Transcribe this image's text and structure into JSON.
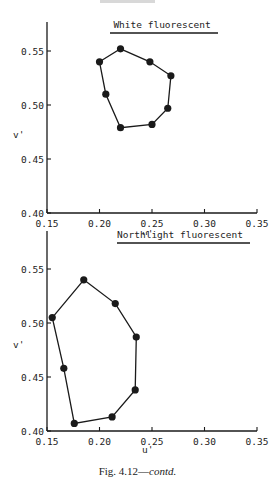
{
  "caption": {
    "prefix": "Fig. 4.12—",
    "suffix": "contd."
  },
  "chart_data": [
    {
      "type": "line",
      "title": "White fluorescent",
      "xlabel": "u'",
      "ylabel": "v'",
      "xlim": [
        0.15,
        0.35
      ],
      "ylim": [
        0.4,
        0.55
      ],
      "xticks": [
        "0.15",
        "0.20",
        "0.25",
        "0.30",
        "0.35"
      ],
      "yticks": [
        "0.40",
        "0.45",
        "0.50",
        "0.55"
      ],
      "grid": false,
      "closed_polygon": true,
      "points": [
        {
          "u": 0.22,
          "v": 0.552
        },
        {
          "u": 0.248,
          "v": 0.54
        },
        {
          "u": 0.268,
          "v": 0.527
        },
        {
          "u": 0.265,
          "v": 0.497
        },
        {
          "u": 0.25,
          "v": 0.482
        },
        {
          "u": 0.22,
          "v": 0.479
        },
        {
          "u": 0.206,
          "v": 0.51
        },
        {
          "u": 0.2,
          "v": 0.54
        }
      ]
    },
    {
      "type": "line",
      "title": "Northlight fluorescent",
      "xlabel": "u'",
      "ylabel": "v'",
      "xlim": [
        0.15,
        0.35
      ],
      "ylim": [
        0.4,
        0.55
      ],
      "xticks": [
        "0.15",
        "0.20",
        "0.25",
        "0.30",
        "0.35"
      ],
      "yticks": [
        "0.40",
        "0.45",
        "0.50",
        "0.55"
      ],
      "grid": false,
      "closed_polygon": true,
      "points": [
        {
          "u": 0.185,
          "v": 0.54
        },
        {
          "u": 0.215,
          "v": 0.518
        },
        {
          "u": 0.235,
          "v": 0.487
        },
        {
          "u": 0.234,
          "v": 0.438
        },
        {
          "u": 0.212,
          "v": 0.413
        },
        {
          "u": 0.176,
          "v": 0.407
        },
        {
          "u": 0.166,
          "v": 0.458
        },
        {
          "u": 0.155,
          "v": 0.505
        }
      ]
    }
  ]
}
